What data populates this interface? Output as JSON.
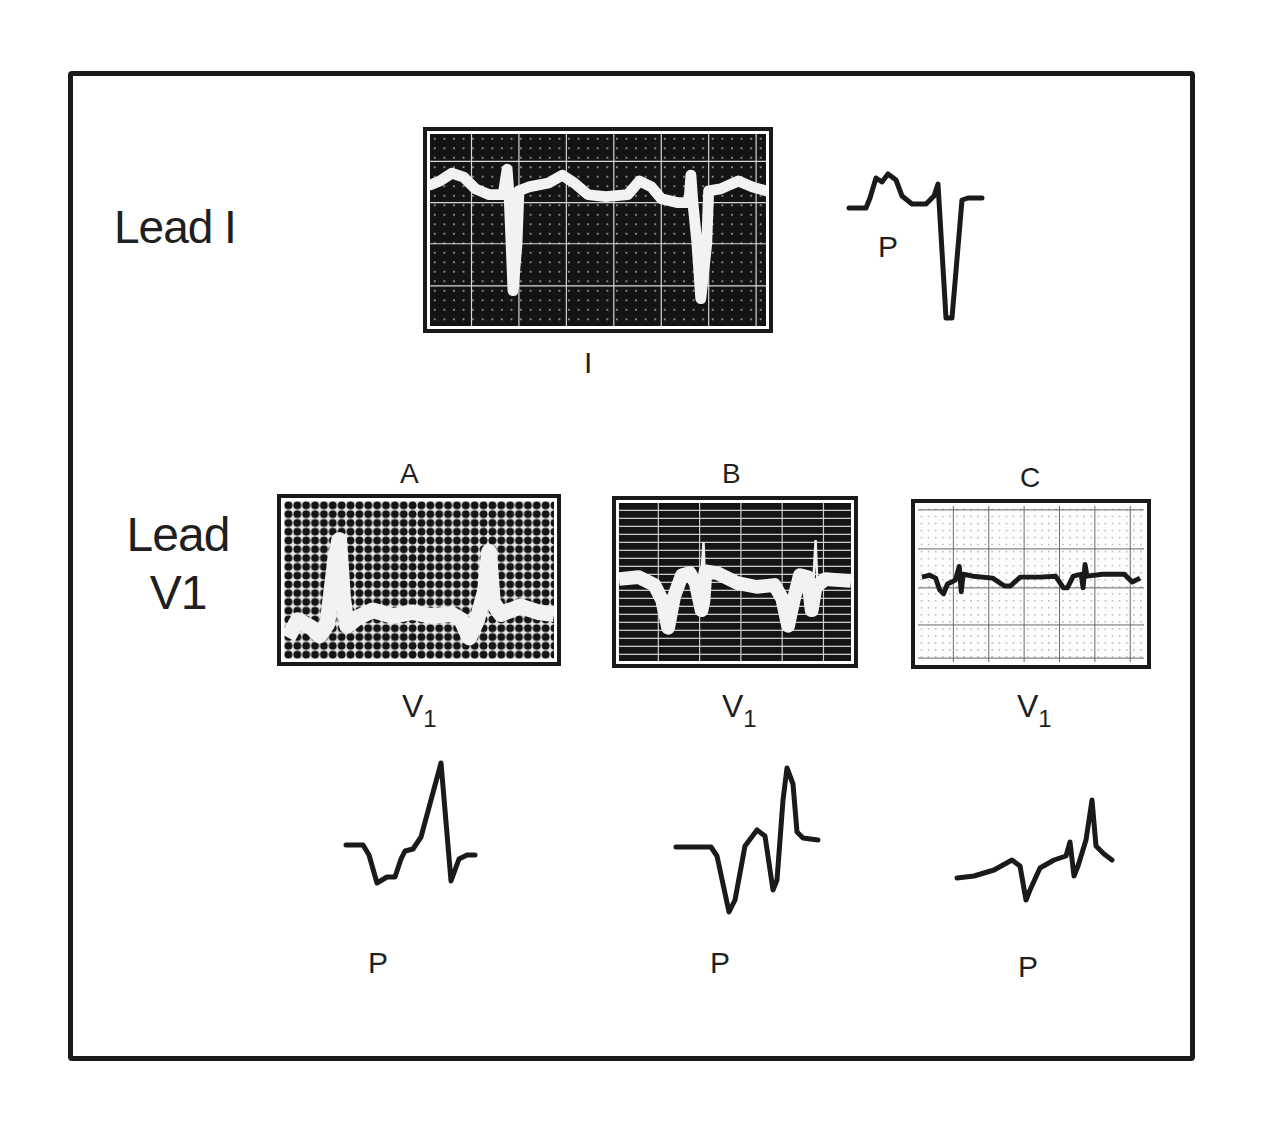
{
  "figure": {
    "lead_i": {
      "title": "Lead I",
      "screen_caption": "I",
      "schematic_label": "P"
    },
    "lead_v1": {
      "title_line1": "Lead",
      "title_line2": "V1",
      "panels": [
        {
          "letter": "A",
          "caption_main": "V",
          "caption_sub": "1",
          "schematic_label": "P",
          "screen_style": "dark"
        },
        {
          "letter": "B",
          "caption_main": "V",
          "caption_sub": "1",
          "schematic_label": "P",
          "screen_style": "dark"
        },
        {
          "letter": "C",
          "caption_main": "V",
          "caption_sub": "1",
          "schematic_label": "P",
          "screen_style": "light"
        }
      ]
    },
    "colors": {
      "ink": "#1a1a1a",
      "screen_dark": "#141414",
      "trace_bright": "#f2f2f2",
      "paper": "#ffffff"
    }
  }
}
